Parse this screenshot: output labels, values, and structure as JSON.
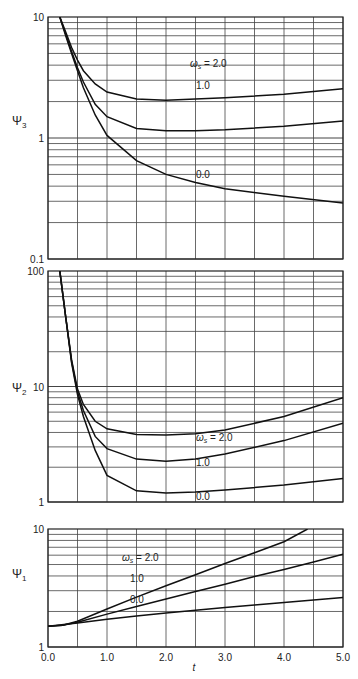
{
  "chart_data": [
    {
      "type": "line",
      "panel": "top",
      "ylabel": "Ψ3",
      "xlabel": "",
      "yscale": "log",
      "ylim": [
        0.1,
        10
      ],
      "ytick_labels": [
        "0.1",
        "1",
        "10"
      ],
      "xlim": [
        0,
        5
      ],
      "grid": true,
      "series": [
        {
          "name": "ω_s = 2.0",
          "label": "ωs = 2.0",
          "x": [
            0.2,
            0.3,
            0.4,
            0.5,
            0.6,
            0.8,
            1.0,
            1.5,
            2.0,
            2.5,
            3.0,
            4.0,
            5.0
          ],
          "y": [
            10,
            7.5,
            5.6,
            4.4,
            3.6,
            2.8,
            2.4,
            2.1,
            2.05,
            2.1,
            2.15,
            2.3,
            2.55
          ]
        },
        {
          "name": "ω_s = 1.0",
          "label": "1.0",
          "x": [
            0.2,
            0.3,
            0.4,
            0.5,
            0.6,
            0.8,
            1.0,
            1.5,
            2.0,
            2.5,
            3.0,
            4.0,
            5.0
          ],
          "y": [
            10,
            7.2,
            5.2,
            3.8,
            2.9,
            1.9,
            1.5,
            1.2,
            1.15,
            1.15,
            1.17,
            1.25,
            1.38
          ]
        },
        {
          "name": "ω_s = 0.0",
          "label": "0.0",
          "x": [
            0.2,
            0.3,
            0.4,
            0.5,
            0.6,
            0.8,
            1.0,
            1.5,
            2.0,
            2.5,
            3.0,
            4.0,
            5.0
          ],
          "y": [
            10,
            7.0,
            5.0,
            3.6,
            2.6,
            1.55,
            1.05,
            0.65,
            0.5,
            0.43,
            0.38,
            0.33,
            0.29
          ]
        }
      ]
    },
    {
      "type": "line",
      "panel": "middle",
      "ylabel": "Ψ2",
      "xlabel": "",
      "yscale": "log",
      "ylim": [
        1,
        100
      ],
      "ytick_labels": [
        "1",
        "10",
        "100"
      ],
      "xlim": [
        0,
        5
      ],
      "grid": true,
      "series": [
        {
          "name": "ω_s = 2.0",
          "label": "ωs = 2.0",
          "x": [
            0.2,
            0.3,
            0.4,
            0.5,
            0.6,
            0.8,
            1.0,
            1.5,
            2.0,
            2.5,
            3.0,
            4.0,
            5.0
          ],
          "y": [
            100,
            40,
            17,
            9.5,
            7.0,
            5.0,
            4.3,
            3.85,
            3.8,
            3.9,
            4.2,
            5.5,
            8.0
          ]
        },
        {
          "name": "ω_s = 1.0",
          "label": "1.0",
          "x": [
            0.2,
            0.3,
            0.4,
            0.5,
            0.6,
            0.8,
            1.0,
            1.5,
            2.0,
            2.5,
            3.0,
            4.0,
            5.0
          ],
          "y": [
            100,
            40,
            16.5,
            9.0,
            6.2,
            3.7,
            2.9,
            2.35,
            2.25,
            2.35,
            2.6,
            3.4,
            4.8
          ]
        },
        {
          "name": "ω_s = 0.0",
          "label": "0.0",
          "x": [
            0.2,
            0.3,
            0.4,
            0.5,
            0.6,
            0.8,
            1.0,
            1.5,
            2.0,
            2.5,
            3.0,
            4.0,
            5.0
          ],
          "y": [
            100,
            40,
            16,
            8.5,
            5.5,
            2.8,
            1.7,
            1.25,
            1.2,
            1.22,
            1.27,
            1.4,
            1.6
          ]
        }
      ]
    },
    {
      "type": "line",
      "panel": "bottom",
      "ylabel": "Ψ1",
      "xlabel": "t",
      "yscale": "log",
      "ylim": [
        1,
        10
      ],
      "ytick_labels": [
        "1",
        "10"
      ],
      "xlim": [
        0,
        5
      ],
      "xtick_labels": [
        "0.0",
        "1.0",
        "2.0",
        "3.0",
        "4.0",
        "5.0"
      ],
      "grid": true,
      "series": [
        {
          "name": "ω_s = 2.0",
          "label": "ωs = 2.0",
          "x": [
            0,
            0.25,
            0.5,
            1.0,
            1.5,
            2.0,
            2.5,
            3.0,
            3.5,
            4.0,
            4.4
          ],
          "y": [
            1.5,
            1.53,
            1.65,
            2.1,
            2.65,
            3.3,
            4.1,
            5.1,
            6.3,
            7.8,
            10
          ]
        },
        {
          "name": "ω_s = 1.0",
          "label": "1.0",
          "x": [
            0,
            0.25,
            0.5,
            1.0,
            1.5,
            2.0,
            2.5,
            3.0,
            3.5,
            4.0,
            4.5,
            5.0
          ],
          "y": [
            1.5,
            1.53,
            1.62,
            1.9,
            2.2,
            2.55,
            2.95,
            3.4,
            3.95,
            4.55,
            5.25,
            6.1
          ]
        },
        {
          "name": "ω_s = 0.0",
          "label": "0.0",
          "x": [
            0,
            0.5,
            1.0,
            1.5,
            2.0,
            2.5,
            3.0,
            3.5,
            4.0,
            4.5,
            5.0
          ],
          "y": [
            1.5,
            1.6,
            1.72,
            1.83,
            1.94,
            2.05,
            2.16,
            2.27,
            2.38,
            2.5,
            2.62
          ]
        }
      ]
    }
  ],
  "labels": {
    "x_axis_title": "t",
    "panel_top_ylabel": "Ψ3",
    "panel_mid_ylabel": "Ψ2",
    "panel_bot_ylabel": "Ψ1"
  }
}
